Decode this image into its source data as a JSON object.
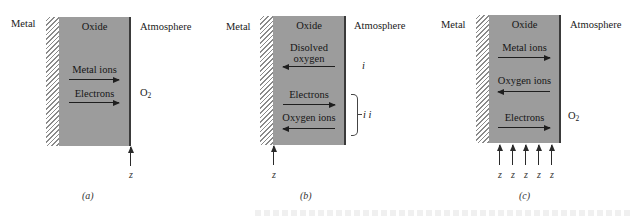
{
  "figure": {
    "panels": [
      {
        "id": "a",
        "caption": "(a)",
        "labels": {
          "left": "Metal",
          "center": "Oxide",
          "right": "Atmosphere"
        },
        "flows": [
          {
            "label": "Metal ions",
            "direction": "right"
          },
          {
            "label": "Electrons",
            "direction": "right"
          }
        ],
        "atmosphere_species": {
          "base": "O",
          "sub": "2"
        },
        "reaction_site_label": "z",
        "reaction_site": "oxide-atmosphere interface"
      },
      {
        "id": "b",
        "caption": "(b)",
        "labels": {
          "left": "Metal",
          "center": "Oxide",
          "right": "Atmosphere"
        },
        "flows": [
          {
            "label_line1": "Disolved",
            "label_line2": "oxygen",
            "direction": "left",
            "mechanism": "i"
          },
          {
            "label": "Electrons",
            "direction": "right",
            "mechanism": "i i"
          },
          {
            "label": "Oxygen ions",
            "direction": "left",
            "mechanism": "i i"
          }
        ],
        "mechanism_labels": {
          "first": "i",
          "second": "i i"
        },
        "reaction_site_label": "z",
        "reaction_site": "metal-oxide interface"
      },
      {
        "id": "c",
        "caption": "(c)",
        "labels": {
          "left": "Metal",
          "center": "Oxide",
          "right": "Atmosphere"
        },
        "flows": [
          {
            "label": "Metal ions",
            "direction": "right"
          },
          {
            "label": "Oxygen ions",
            "direction": "left"
          },
          {
            "label": "Electrons",
            "direction": "right"
          }
        ],
        "atmosphere_species": {
          "base": "O",
          "sub": "2"
        },
        "reaction_site_labels": [
          "z",
          "z",
          "z",
          "z",
          "z"
        ],
        "reaction_site": "distributed within oxide"
      }
    ],
    "colors": {
      "oxide_fill": "#9c9c9c",
      "hatch": "#8a8a8a",
      "arrow": "#1e1e1e",
      "text": "#1a1a1a"
    }
  }
}
